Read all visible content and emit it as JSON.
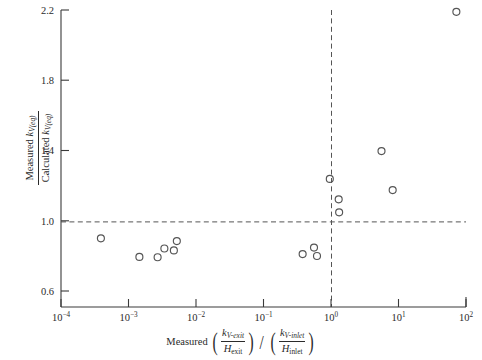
{
  "chart_data": {
    "type": "scatter",
    "title": "",
    "xlabel": "Measured (k_V-exit / H_exit) / (k_V-inlet / H_inlet)",
    "ylabel": "Measured k_V(eq) / Calculated k_V(eq)",
    "xscale": "log",
    "yscale": "linear",
    "xlim": [
      0.0001,
      100
    ],
    "ylim": [
      0.6,
      2.2
    ],
    "xticks": [
      0.0001,
      0.001,
      0.01,
      0.1,
      1,
      10,
      100
    ],
    "xtick_labels": [
      "10−4",
      "10−3",
      "10−2",
      "10−1",
      "10⁰",
      "10¹",
      "10²"
    ],
    "yticks": [
      0.6,
      1.0,
      1.4,
      1.8,
      2.2
    ],
    "ytick_labels": [
      "0.6",
      "1.0",
      "1.4",
      "1.8",
      "2.2"
    ],
    "grid": false,
    "legend": null,
    "marker": "open-circle",
    "marker_color": "#555555",
    "reference_lines": [
      {
        "name": "y-unity-line",
        "orientation": "horizontal",
        "value": 1.0,
        "style": "dashed"
      },
      {
        "name": "x-unity-line",
        "orientation": "vertical",
        "value": 1.0,
        "style": "dashed"
      }
    ],
    "points": [
      {
        "x": 0.00039,
        "y": 0.97
      },
      {
        "x": 0.00145,
        "y": 0.87
      },
      {
        "x": 0.0027,
        "y": 0.868
      },
      {
        "x": 0.0034,
        "y": 0.915
      },
      {
        "x": 0.0047,
        "y": 0.905
      },
      {
        "x": 0.0052,
        "y": 0.955
      },
      {
        "x": 0.38,
        "y": 0.885
      },
      {
        "x": 0.56,
        "y": 0.92
      },
      {
        "x": 0.62,
        "y": 0.875
      },
      {
        "x": 0.96,
        "y": 1.29
      },
      {
        "x": 1.3,
        "y": 1.18
      },
      {
        "x": 1.32,
        "y": 1.11
      },
      {
        "x": 5.6,
        "y": 1.44
      },
      {
        "x": 8.2,
        "y": 1.23
      },
      {
        "x": 72.0,
        "y": 2.19
      }
    ]
  },
  "axis_text": {
    "y_numerator_pre": "Measured ",
    "y_numerator_sym": "k",
    "y_numerator_sub": "V(eq)",
    "y_denominator_pre": "Calculated ",
    "y_denominator_sym": "k",
    "y_denominator_sub": "V(eq)",
    "x_prefix": "Measured",
    "x_num1_sym": "k",
    "x_num1_sub": "V-exit",
    "x_den1_sym": "H",
    "x_den1_sub": "exit",
    "x_divider": "/",
    "x_num2_sym": "k",
    "x_num2_sub": "V-inlet",
    "x_den2_sym": "H",
    "x_den2_sub": "inlet",
    "paren_open": "(",
    "paren_close": ")"
  }
}
